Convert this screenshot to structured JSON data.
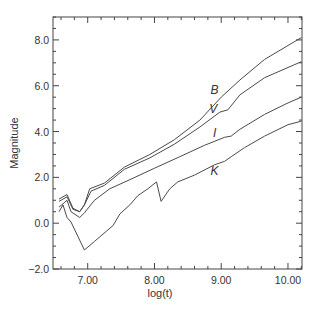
{
  "chart_data": {
    "type": "line",
    "title": "",
    "xlabel": "log(t)",
    "ylabel": "Magnitude",
    "xlim": [
      6.48,
      10.21
    ],
    "ylim": [
      -2.0,
      9.0
    ],
    "grid": false,
    "legend": "inline labels",
    "x_ticks": [
      {
        "value": 7.0,
        "label": "7.00"
      },
      {
        "value": 8.0,
        "label": "8.00"
      },
      {
        "value": 9.0,
        "label": "9.00"
      },
      {
        "value": 10.0,
        "label": "10.00"
      }
    ],
    "y_ticks": [
      {
        "value": -2.0,
        "label": "−2.0"
      },
      {
        "value": 0.0,
        "label": "0.0"
      },
      {
        "value": 2.0,
        "label": "2.0"
      },
      {
        "value": 4.0,
        "label": "4.0"
      },
      {
        "value": 6.0,
        "label": "6.0"
      },
      {
        "value": 8.0,
        "label": "8.0"
      }
    ],
    "series": [
      {
        "name": "B",
        "label_pos": [
          8.9,
          5.65
        ],
        "points": [
          [
            6.57,
            1.05
          ],
          [
            6.69,
            1.25
          ],
          [
            6.78,
            0.65
          ],
          [
            6.88,
            0.5
          ],
          [
            6.95,
            0.8
          ],
          [
            7.03,
            1.5
          ],
          [
            7.25,
            1.75
          ],
          [
            7.55,
            2.45
          ],
          [
            7.93,
            3.0
          ],
          [
            8.3,
            3.65
          ],
          [
            8.68,
            4.5
          ],
          [
            9.0,
            5.5
          ],
          [
            9.28,
            6.25
          ],
          [
            9.65,
            7.15
          ],
          [
            10.2,
            8.1
          ]
        ]
      },
      {
        "name": "V",
        "label_pos": [
          8.88,
          4.8
        ],
        "points": [
          [
            6.57,
            0.95
          ],
          [
            6.69,
            1.15
          ],
          [
            6.78,
            0.6
          ],
          [
            6.88,
            0.5
          ],
          [
            6.95,
            0.8
          ],
          [
            7.05,
            1.4
          ],
          [
            7.25,
            1.65
          ],
          [
            7.55,
            2.35
          ],
          [
            7.93,
            2.85
          ],
          [
            8.3,
            3.45
          ],
          [
            8.68,
            4.2
          ],
          [
            8.98,
            4.85
          ],
          [
            9.1,
            4.95
          ],
          [
            9.28,
            5.6
          ],
          [
            9.65,
            6.35
          ],
          [
            10.2,
            7.05
          ]
        ]
      },
      {
        "name": "I",
        "label_pos": [
          8.9,
          3.75
        ],
        "points": [
          [
            6.57,
            0.7
          ],
          [
            6.69,
            1.0
          ],
          [
            6.75,
            0.5
          ],
          [
            6.88,
            0.25
          ],
          [
            6.95,
            0.45
          ],
          [
            7.1,
            1.0
          ],
          [
            7.33,
            1.5
          ],
          [
            7.63,
            1.9
          ],
          [
            8.0,
            2.4
          ],
          [
            8.38,
            2.9
          ],
          [
            8.75,
            3.4
          ],
          [
            9.05,
            3.75
          ],
          [
            9.15,
            3.8
          ],
          [
            9.28,
            4.1
          ],
          [
            9.65,
            4.75
          ],
          [
            10.0,
            5.25
          ],
          [
            10.2,
            5.5
          ]
        ]
      },
      {
        "name": "K",
        "label_pos": [
          8.9,
          2.1
        ],
        "points": [
          [
            6.57,
            0.5
          ],
          [
            6.63,
            0.8
          ],
          [
            6.69,
            0.25
          ],
          [
            6.75,
            0.05
          ],
          [
            6.95,
            -1.17
          ],
          [
            7.1,
            -0.8
          ],
          [
            7.28,
            -0.35
          ],
          [
            7.38,
            -0.1
          ],
          [
            7.48,
            0.4
          ],
          [
            7.63,
            0.8
          ],
          [
            7.75,
            1.2
          ],
          [
            7.9,
            1.5
          ],
          [
            8.03,
            1.8
          ],
          [
            8.1,
            0.95
          ],
          [
            8.23,
            1.5
          ],
          [
            8.35,
            1.8
          ],
          [
            8.6,
            2.1
          ],
          [
            8.9,
            2.55
          ],
          [
            9.05,
            2.7
          ],
          [
            9.15,
            2.9
          ],
          [
            9.35,
            3.3
          ],
          [
            9.65,
            3.8
          ],
          [
            10.0,
            4.3
          ],
          [
            10.2,
            4.45
          ]
        ]
      }
    ]
  },
  "plot_box": {
    "left": 53,
    "right": 302,
    "top": 17,
    "bottom": 269
  },
  "colors": {
    "line": "#4a4a4a",
    "axis": "#444444",
    "text": "#333333"
  }
}
